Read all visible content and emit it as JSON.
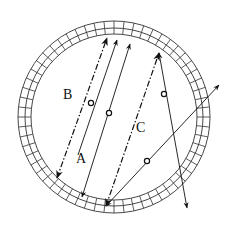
{
  "diagram": {
    "type": "ray-path schematic in circular ring",
    "ring": {
      "cx": 114,
      "cy": 117,
      "outer_r": 96,
      "mid_r": 89,
      "inner_r": 83,
      "cell_count": 60,
      "stroke": "#333333"
    },
    "labels": [
      {
        "id": "label-b",
        "text": "B",
        "x": 63,
        "y": 88
      },
      {
        "id": "label-a",
        "text": "A",
        "x": 76,
        "y": 152
      },
      {
        "id": "label-c",
        "text": "C",
        "x": 136,
        "y": 121
      }
    ],
    "paths": [
      {
        "id": "path-b-dashdot",
        "style": "dashdot",
        "from": [
          57,
          178
        ],
        "to": [
          107,
          38
        ],
        "arrows": [
          "start",
          "end"
        ]
      },
      {
        "id": "path-b-solid",
        "style": "solid",
        "from": [
          78,
          155
        ],
        "to": [
          117,
          40
        ],
        "arrows": [
          "end"
        ],
        "marker_at": [
          91,
          103
        ]
      },
      {
        "id": "path-a",
        "style": "solid",
        "from": [
          82,
          197
        ],
        "to": [
          130,
          44
        ],
        "arrows": [
          "start",
          "end"
        ],
        "marker_at": [
          109,
          113
        ]
      },
      {
        "id": "path-c-dashdot",
        "style": "dashdot",
        "from": [
          106,
          206
        ],
        "to": [
          159,
          53
        ],
        "arrows": [
          "start",
          "end"
        ]
      },
      {
        "id": "path-c-diag",
        "style": "solid",
        "from": [
          106,
          206
        ],
        "to": [
          219,
          85
        ],
        "arrows": [
          "start",
          "end"
        ],
        "marker_at": [
          147,
          161
        ]
      },
      {
        "id": "path-right",
        "style": "solid",
        "from": [
          159,
          53
        ],
        "to": [
          187,
          208
        ],
        "arrows": [
          "start",
          "end"
        ],
        "marker_at": [
          164,
          94
        ]
      }
    ]
  }
}
